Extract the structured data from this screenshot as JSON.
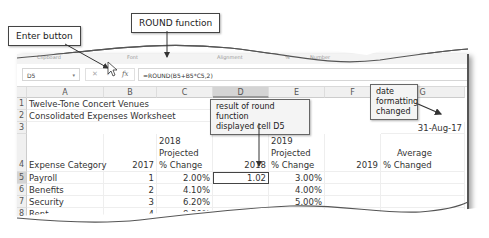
{
  "ribbon": {
    "groups": [
      "Clipboard",
      "Font",
      "Alignment",
      "%",
      "Number"
    ]
  },
  "formula_bar": {
    "name_box": "D5",
    "cancel_glyph": "✕",
    "enter_glyph": "✓",
    "fx_label": "fx",
    "formula": "=ROUND(B5+B5*C5,2)"
  },
  "columns": [
    "A",
    "B",
    "C",
    "D",
    "E",
    "F",
    "G"
  ],
  "selected_column": "D",
  "rows": {
    "r1": {
      "num": "1",
      "A": "Twelve-Tone Concert Venues"
    },
    "r2": {
      "num": "2",
      "A": "Consolidated Expenses Worksheet"
    },
    "r3": {
      "num": "3",
      "G": "31-Aug-17"
    },
    "r4": {
      "num": "4",
      "A": "Expense Category",
      "B": "2017",
      "C1": "2018",
      "C2": "Projected",
      "C3": "% Change",
      "D": "2018",
      "E1": "2019",
      "E2": "Projected",
      "E3": "% Change",
      "F": "2019",
      "G1": "Average",
      "G2": "% Changed"
    },
    "r5": {
      "num": "5",
      "A": "Payroll",
      "B": "1",
      "C": "2.00%",
      "D": "1.02",
      "E": "3.00%"
    },
    "r6": {
      "num": "6",
      "A": "Benefits",
      "B": "2",
      "C": "4.10%",
      "E": "4.00%"
    },
    "r7": {
      "num": "7",
      "A": "Security",
      "B": "3",
      "C": "6.20%",
      "E": "5.00%"
    },
    "r8": {
      "num": "8",
      "A": "Rent",
      "B": "4",
      "C": "8.30%",
      "E": "6.00%"
    }
  },
  "callouts": {
    "enter_button": "Enter button",
    "round_function": "ROUND function",
    "round_result_1": "result of round function",
    "round_result_2": "displayed cell D5",
    "date_1": "date",
    "date_2": "formatting",
    "date_3": "changed"
  }
}
